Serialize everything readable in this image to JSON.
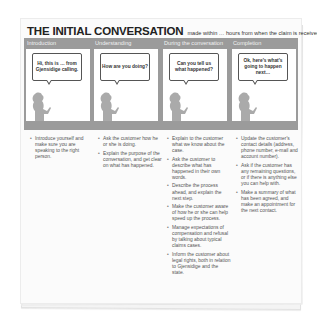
{
  "header": {
    "title": "THE INITIAL CONVERSATION",
    "subtitle": "made within … hours from when the claim is received"
  },
  "colors": {
    "band": "#9b9b9b",
    "panel": "#ffffff",
    "figure": "#aaaaaa",
    "title_text": "#222222",
    "body_text": "#555555"
  },
  "columns": [
    {
      "heading": "Introduction",
      "speech": "Hi, this is … from Gjensidige calling.",
      "icon": "person-speaking-icon",
      "bullets": [
        "Introduce yourself and make sure you are speaking to the right person."
      ]
    },
    {
      "heading": "Understanding",
      "speech": "How are you doing?",
      "icon": "person-speaking-icon",
      "bullets": [
        "Ask the customer how he or she is doing.",
        "Explain the purpose of the conversation, and get clear on what has happened."
      ]
    },
    {
      "heading": "During the conversation",
      "speech": "Can you tell us what happened?",
      "icon": "person-speaking-icon",
      "bullets": [
        "Explain to the customer what we know about the case.",
        "Ask the customer to describe what has happened in their own words.",
        "Describe the process ahead, and explain the next step.",
        "Make the customer aware of how he or she can help speed up the process.",
        "Manage expectations of compensation and refusal by talking about typical claims cases.",
        "Inform the customer about legal rights, both in relation to Gjensidige and the state."
      ]
    },
    {
      "heading": "Completion",
      "speech": "Ok, here's what's going to happen next…",
      "icon": "person-speaking-icon",
      "bullets": [
        "Update the customer's contact details (address, phone number, e-mail and account number).",
        "Ask if the customer has any remaining questions, or if there is anything else you can help with.",
        "Make a summary of what has been agreed, and make an appointment for the next contact."
      ]
    }
  ]
}
